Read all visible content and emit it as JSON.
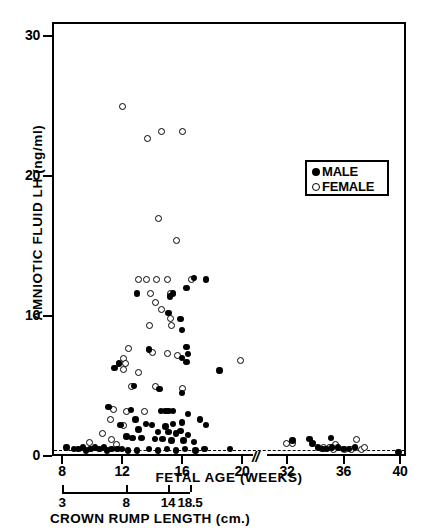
{
  "axes": {
    "y": {
      "label": "AMNIOTIC  FLUID  LH  (ng/ml)",
      "ticks": [
        {
          "value": 0,
          "label": "0"
        },
        {
          "value": 10,
          "label": "10"
        },
        {
          "value": 20,
          "label": "20"
        },
        {
          "value": 30,
          "label": "30"
        }
      ],
      "min": 0,
      "max": 31
    },
    "x": {
      "label": "FETAL  AGE  (WEEKS)",
      "ticks": [
        {
          "value": 8,
          "label": "8"
        },
        {
          "value": 12,
          "label": "12"
        },
        {
          "value": 16,
          "label": "16"
        },
        {
          "value": 20,
          "label": "20"
        },
        {
          "value": 32,
          "label": "32"
        },
        {
          "value": 36,
          "label": "36"
        },
        {
          "value": 40,
          "label": "40"
        }
      ],
      "break_symbol": "//",
      "break_after": 20,
      "break_before": 32
    },
    "secondary_x": {
      "label": "CROWN  RUMP  LENGTH  (cm.)",
      "ticks": [
        {
          "label": "3"
        },
        {
          "label": "8"
        },
        {
          "label": "14"
        },
        {
          "label": "18.5"
        }
      ]
    }
  },
  "legend": {
    "entries": [
      {
        "marker": "filled-circle",
        "label": "MALE"
      },
      {
        "marker": "open-circle",
        "label": "FEMALE"
      }
    ]
  },
  "annotations": {
    "baseline": {
      "style": "dashed",
      "value": 0.45,
      "description": "assay detection limit"
    }
  },
  "chart_data": {
    "type": "scatter",
    "title": "",
    "xlabel": "FETAL AGE (WEEKS)",
    "ylabel": "AMNIOTIC FLUID LH (ng/ml)",
    "xlim": [
      7.4,
      40.8
    ],
    "ylim": [
      0,
      31
    ],
    "grid": false,
    "legend_position": "upper-right-inside",
    "axis_break": {
      "from": 20.8,
      "to": 31.2,
      "symbol": "//"
    },
    "series": [
      {
        "name": "FEMALE",
        "marker": "open-circle",
        "points": [
          [
            12.0,
            25.0
          ],
          [
            13.7,
            22.7
          ],
          [
            14.6,
            23.2
          ],
          [
            16.0,
            23.2
          ],
          [
            14.4,
            17.0
          ],
          [
            15.6,
            15.4
          ],
          [
            13.1,
            12.6
          ],
          [
            13.6,
            12.6
          ],
          [
            14.3,
            12.6
          ],
          [
            15.0,
            12.6
          ],
          [
            16.6,
            12.6
          ],
          [
            13.9,
            11.6
          ],
          [
            15.2,
            11.6
          ],
          [
            14.2,
            11.0
          ],
          [
            14.6,
            10.5
          ],
          [
            15.2,
            9.8
          ],
          [
            13.8,
            9.3
          ],
          [
            15.3,
            9.3
          ],
          [
            12.4,
            7.7
          ],
          [
            14.0,
            7.4
          ],
          [
            15.0,
            7.3
          ],
          [
            15.7,
            7.2
          ],
          [
            12.1,
            7.0
          ],
          [
            12.2,
            6.6
          ],
          [
            12.1,
            6.2
          ],
          [
            13.1,
            6.0
          ],
          [
            19.9,
            6.8
          ],
          [
            12.6,
            5.0
          ],
          [
            14.2,
            5.0
          ],
          [
            16.0,
            4.8
          ],
          [
            11.4,
            3.3
          ],
          [
            12.3,
            3.2
          ],
          [
            13.5,
            3.2
          ],
          [
            11.2,
            2.6
          ],
          [
            12.1,
            2.2
          ],
          [
            10.7,
            1.6
          ],
          [
            11.3,
            1.2
          ],
          [
            9.8,
            1.0
          ],
          [
            11.6,
            0.8
          ],
          [
            31.9,
            0.9
          ],
          [
            32.4,
            0.9
          ],
          [
            34.6,
            0.6
          ],
          [
            35.0,
            0.6
          ],
          [
            35.3,
            0.5
          ],
          [
            35.4,
            0.8
          ],
          [
            36.1,
            0.5
          ],
          [
            36.6,
            0.5
          ],
          [
            36.9,
            1.2
          ],
          [
            37.3,
            0.5
          ],
          [
            37.5,
            0.6
          ]
        ]
      },
      {
        "name": "MALE",
        "marker": "filled-circle",
        "points": [
          [
            16.8,
            12.7
          ],
          [
            17.6,
            12.6
          ],
          [
            13.0,
            11.6
          ],
          [
            15.4,
            11.6
          ],
          [
            15.2,
            11.4
          ],
          [
            15.1,
            10.2
          ],
          [
            16.3,
            12.0
          ],
          [
            15.9,
            9.8
          ],
          [
            16.0,
            9.0
          ],
          [
            13.8,
            7.6
          ],
          [
            16.3,
            7.8
          ],
          [
            16.4,
            7.3
          ],
          [
            16.0,
            7.0
          ],
          [
            16.3,
            6.7
          ],
          [
            18.5,
            6.1
          ],
          [
            11.8,
            6.6
          ],
          [
            11.5,
            6.3
          ],
          [
            12.8,
            5.0
          ],
          [
            14.5,
            4.8
          ],
          [
            16.0,
            4.5
          ],
          [
            11.1,
            3.5
          ],
          [
            12.6,
            3.3
          ],
          [
            14.6,
            3.2
          ],
          [
            14.9,
            3.2
          ],
          [
            15.1,
            3.2
          ],
          [
            15.4,
            3.2
          ],
          [
            16.4,
            3.0
          ],
          [
            12.9,
            2.6
          ],
          [
            13.6,
            2.3
          ],
          [
            11.9,
            2.2
          ],
          [
            14.0,
            2.2
          ],
          [
            14.9,
            2.1
          ],
          [
            15.4,
            2.3
          ],
          [
            16.0,
            2.4
          ],
          [
            17.2,
            2.6
          ],
          [
            17.6,
            2.2
          ],
          [
            13.1,
            1.9
          ],
          [
            14.4,
            1.7
          ],
          [
            15.1,
            1.7
          ],
          [
            15.6,
            1.6
          ],
          [
            15.9,
            1.8
          ],
          [
            16.4,
            1.5
          ],
          [
            12.3,
            1.4
          ],
          [
            12.7,
            1.3
          ],
          [
            13.3,
            1.3
          ],
          [
            14.2,
            1.2
          ],
          [
            14.7,
            1.2
          ],
          [
            15.3,
            1.1
          ],
          [
            16.1,
            1.1
          ],
          [
            16.8,
            1.0
          ],
          [
            8.3,
            0.6
          ],
          [
            8.8,
            0.5
          ],
          [
            9.1,
            0.5
          ],
          [
            9.4,
            0.6
          ],
          [
            9.6,
            0.4
          ],
          [
            9.9,
            0.5
          ],
          [
            10.2,
            0.6
          ],
          [
            10.5,
            0.5
          ],
          [
            10.8,
            0.6
          ],
          [
            11.0,
            0.4
          ],
          [
            11.3,
            0.5
          ],
          [
            11.7,
            0.5
          ],
          [
            12.0,
            0.5
          ],
          [
            12.4,
            0.4
          ],
          [
            13.0,
            0.4
          ],
          [
            13.8,
            0.5
          ],
          [
            14.4,
            0.4
          ],
          [
            15.0,
            0.5
          ],
          [
            15.6,
            0.4
          ],
          [
            16.2,
            0.5
          ],
          [
            16.9,
            0.4
          ],
          [
            17.5,
            0.5
          ],
          [
            19.2,
            0.5
          ],
          [
            32.4,
            1.1
          ],
          [
            33.6,
            1.2
          ],
          [
            33.8,
            0.9
          ],
          [
            34.2,
            0.6
          ],
          [
            34.5,
            0.5
          ],
          [
            34.8,
            0.5
          ],
          [
            35.1,
            1.3
          ],
          [
            35.2,
            0.6
          ],
          [
            35.6,
            0.6
          ],
          [
            36.0,
            0.5
          ],
          [
            36.4,
            0.5
          ],
          [
            36.8,
            0.6
          ],
          [
            39.9,
            0.3
          ]
        ]
      }
    ]
  }
}
